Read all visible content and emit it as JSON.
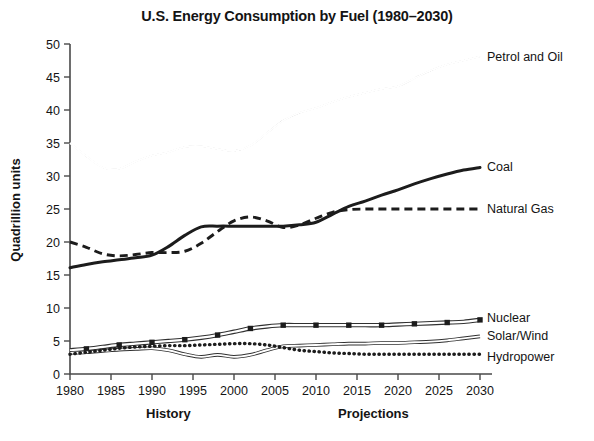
{
  "chart_data": {
    "type": "line",
    "title": "U.S. Energy Consumption by Fuel (1980–2030)",
    "xlabel": "",
    "ylabel": "Quadrillion units",
    "xlim": [
      1980,
      2030
    ],
    "ylim": [
      0,
      50
    ],
    "grid": false,
    "legend_position": "right-inline-labels",
    "x_tick_labels": [
      "1980",
      "1985",
      "1990",
      "1995",
      "2000",
      "2005",
      "2010",
      "2015",
      "2020",
      "2025",
      "2030"
    ],
    "y_tick_labels": [
      "0",
      "5",
      "10",
      "15",
      "20",
      "25",
      "30",
      "35",
      "40",
      "45",
      "50"
    ],
    "x": [
      1980,
      1982,
      1984,
      1986,
      1988,
      1990,
      1992,
      1994,
      1996,
      1998,
      2000,
      2002,
      2004,
      2006,
      2008,
      2010,
      2012,
      2014,
      2016,
      2018,
      2020,
      2022,
      2024,
      2026,
      2028,
      2030
    ],
    "period_annotations": [
      {
        "label": "History",
        "center_year": 1992
      },
      {
        "label": "Projections",
        "center_year": 2017
      }
    ],
    "series": [
      {
        "name": "Petrol and Oil",
        "style": "double-outline",
        "label": "Petrol and Oil",
        "values": [
          35.0,
          33.0,
          31.3,
          31.1,
          32.2,
          33.1,
          33.6,
          34.4,
          34.5,
          34.1,
          33.8,
          34.6,
          36.5,
          38.4,
          39.6,
          40.3,
          41.2,
          42.0,
          42.6,
          43.2,
          43.6,
          44.8,
          46.0,
          46.9,
          47.5,
          48.1
        ]
      },
      {
        "name": "Coal",
        "style": "thick-solid",
        "label": "Coal",
        "values": [
          16.1,
          16.6,
          17.0,
          17.3,
          17.6,
          18.0,
          19.3,
          21.0,
          22.3,
          22.4,
          22.4,
          22.4,
          22.4,
          22.4,
          22.6,
          23.0,
          24.2,
          25.4,
          26.2,
          27.1,
          27.9,
          28.8,
          29.6,
          30.3,
          30.9,
          31.3
        ]
      },
      {
        "name": "Natural Gas",
        "style": "dashed",
        "label": "Natural Gas",
        "values": [
          20.0,
          19.2,
          18.2,
          17.9,
          18.1,
          18.4,
          18.4,
          18.6,
          19.8,
          21.6,
          23.2,
          23.8,
          23.2,
          22.2,
          22.6,
          23.6,
          24.5,
          24.9,
          25.0,
          25.0,
          25.0,
          25.0,
          25.0,
          25.0,
          25.0,
          25.0
        ]
      },
      {
        "name": "Nuclear",
        "style": "outline-with-square-markers",
        "label": "Nuclear",
        "values": [
          3.6,
          3.8,
          4.1,
          4.4,
          4.6,
          4.8,
          5.0,
          5.2,
          5.5,
          5.9,
          6.4,
          6.9,
          7.2,
          7.4,
          7.4,
          7.4,
          7.4,
          7.4,
          7.4,
          7.4,
          7.5,
          7.6,
          7.7,
          7.8,
          7.9,
          8.2
        ]
      },
      {
        "name": "Solar/Wind",
        "style": "thin-outline",
        "label": "Solar/Wind",
        "values": [
          3.2,
          3.3,
          3.5,
          3.7,
          3.8,
          3.9,
          3.6,
          3.0,
          2.6,
          2.9,
          2.6,
          2.9,
          3.6,
          4.2,
          4.3,
          4.4,
          4.5,
          4.6,
          4.6,
          4.7,
          4.7,
          4.8,
          4.9,
          5.1,
          5.4,
          5.7
        ]
      },
      {
        "name": "Hydropower",
        "style": "dotted",
        "label": "Hydropower",
        "values": [
          3.0,
          3.3,
          3.6,
          3.9,
          4.1,
          4.2,
          4.3,
          4.3,
          4.4,
          4.5,
          4.6,
          4.6,
          4.4,
          4.0,
          3.6,
          3.4,
          3.2,
          3.1,
          3.0,
          3.0,
          3.0,
          3.0,
          3.0,
          3.0,
          3.0,
          3.0
        ]
      }
    ]
  }
}
